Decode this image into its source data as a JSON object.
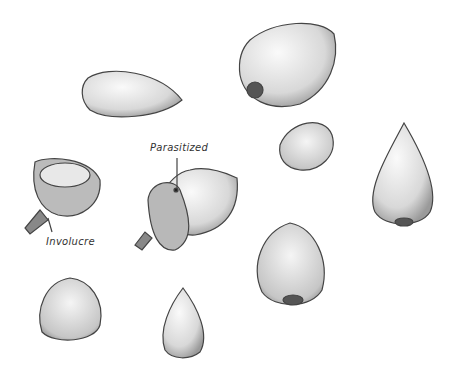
{
  "illustration": {
    "subject": "pencil sketch of acorns / nuts",
    "labels": {
      "parasitized": "Parasitized",
      "involucre": "Involucre"
    },
    "colors": {
      "stroke": "#444444",
      "shade": "#cfcfcf",
      "background": "#ffffff"
    }
  }
}
